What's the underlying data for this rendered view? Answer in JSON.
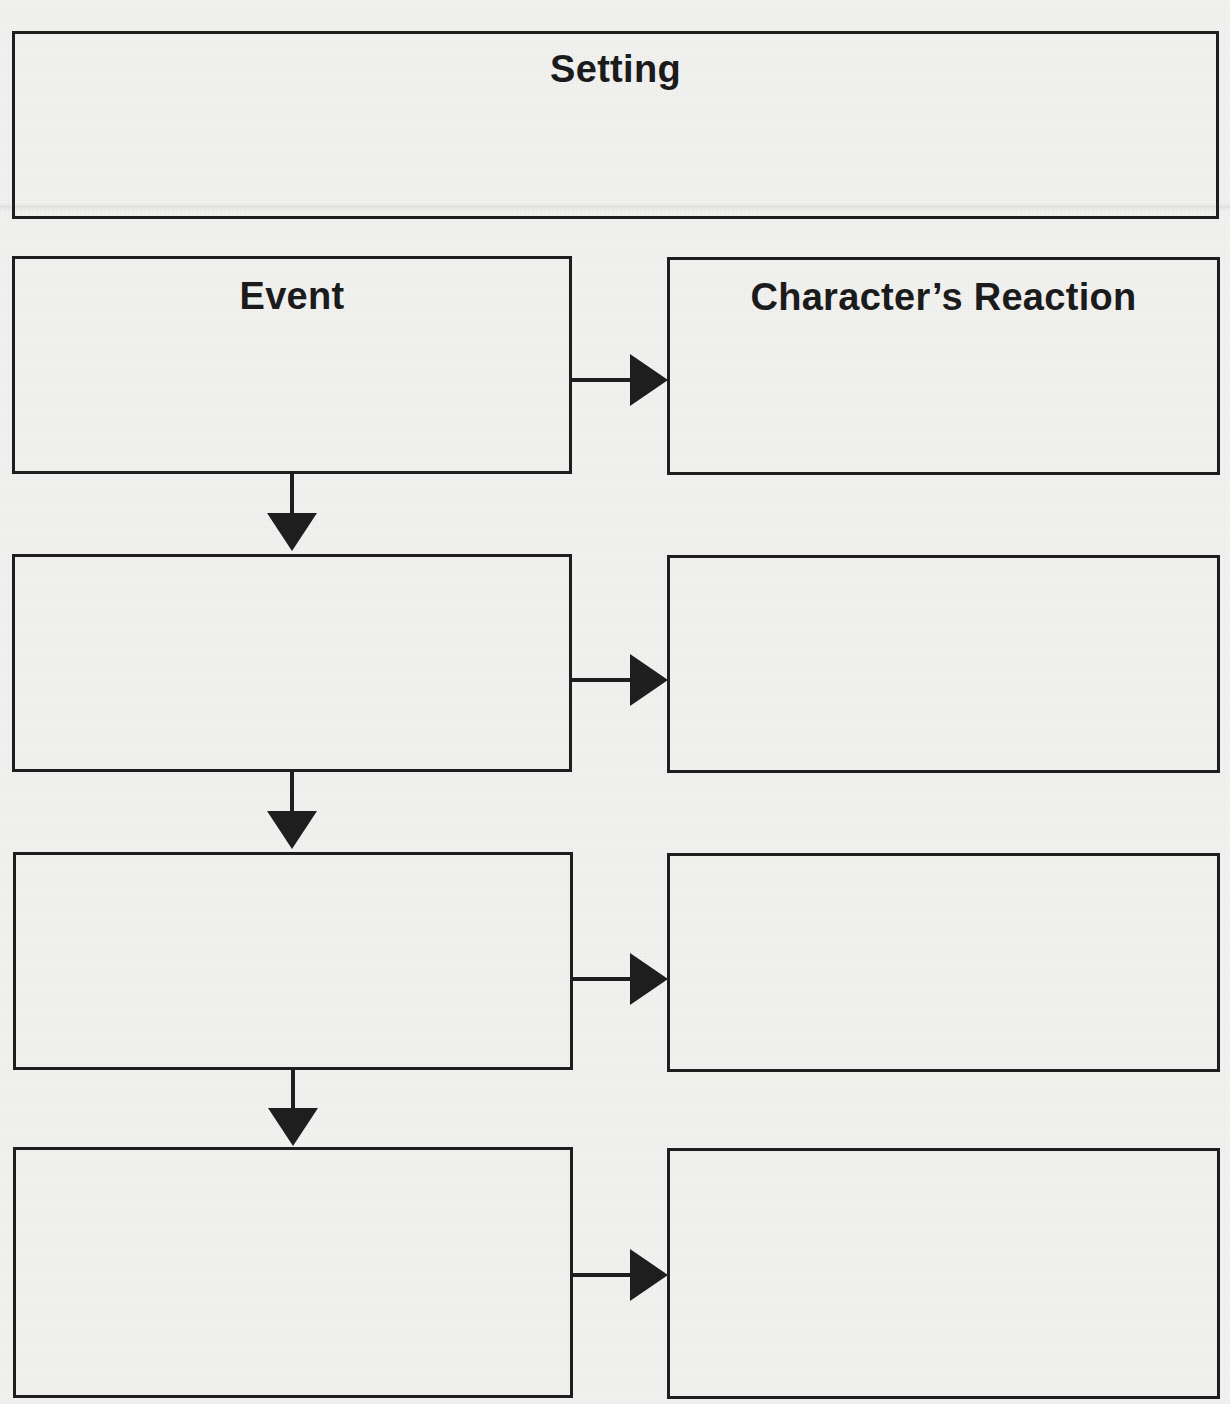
{
  "worksheet": {
    "type": "story sequence organizer",
    "setting": {
      "title": "Setting",
      "content": ""
    },
    "columns": {
      "event_header": "Event",
      "reaction_header": "Character’s Reaction"
    },
    "rows": [
      {
        "event": "",
        "reaction": ""
      },
      {
        "event": "",
        "reaction": ""
      },
      {
        "event": "",
        "reaction": ""
      },
      {
        "event": "",
        "reaction": ""
      }
    ],
    "colors": {
      "ink": "#1e1e1e",
      "paper": "#f1f1ef"
    },
    "connectors": {
      "event_to_reaction": "right-arrow",
      "event_to_next_event": "down-arrow"
    }
  }
}
